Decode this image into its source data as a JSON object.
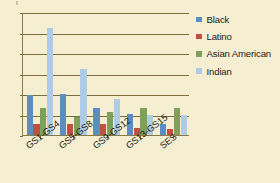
{
  "chart_data": {
    "type": "bar",
    "title": "",
    "xlabel": "",
    "ylabel": "",
    "ylim": [
      0,
      6
    ],
    "ytick_step": 1,
    "yticks": [
      "0",
      "1",
      "2",
      "3",
      "4",
      "5",
      "6"
    ],
    "grid": true,
    "legend_position": "right",
    "categories": [
      "GS1-GS4",
      "GS5-GS8",
      "GS9-GS12",
      "GS13-GS15",
      "SES"
    ],
    "series": [
      {
        "name": "Black",
        "color": "#5b8fc0",
        "values": [
          1.95,
          2.0,
          1.33,
          1.02,
          0.53
        ]
      },
      {
        "name": "Latino",
        "color": "#bf5142",
        "values": [
          0.55,
          0.55,
          0.55,
          0.35,
          0.28
        ]
      },
      {
        "name": "Asian American",
        "color": "#7fa05a",
        "values": [
          1.3,
          0.9,
          1.1,
          1.32,
          1.33
        ]
      },
      {
        "name": "Indian",
        "color": "#aecce4",
        "values": [
          5.2,
          3.2,
          1.78,
          1.0,
          1.0
        ]
      }
    ]
  },
  "legend": {
    "items": [
      {
        "label": "Black"
      },
      {
        "label": "Latino"
      },
      {
        "label": "Asian American"
      },
      {
        "label": "Indian"
      }
    ]
  }
}
